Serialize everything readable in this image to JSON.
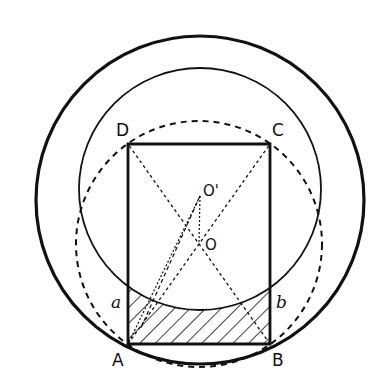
{
  "diagram": {
    "title": "",
    "colors": {
      "ink": "#111111",
      "background": "#ffffff"
    },
    "points": {
      "A": {
        "label": "A",
        "x": 128,
        "y": 344
      },
      "B": {
        "label": "B",
        "x": 270,
        "y": 344
      },
      "C": {
        "label": "C",
        "x": 270,
        "y": 144
      },
      "D": {
        "label": "D",
        "x": 128,
        "y": 144
      },
      "O": {
        "label": "O",
        "x": 199,
        "y": 244
      },
      "O_prime": {
        "label": "O'",
        "x": 200,
        "y": 196
      },
      "a": {
        "label": "a",
        "x": 128,
        "y": 300
      },
      "b": {
        "label": "b",
        "x": 270,
        "y": 300
      }
    },
    "circles": [
      {
        "name": "outer-circle",
        "cx": 200,
        "cy": 200,
        "r": 164,
        "style": "solid-thick"
      },
      {
        "name": "inner-circle",
        "cx": 200,
        "cy": 189,
        "r": 121,
        "style": "solid"
      },
      {
        "name": "circumscribed-circle",
        "cx": 199,
        "cy": 244,
        "r": 123,
        "style": "dashed"
      }
    ],
    "hatched_region": "segment between chord AB and arc a-b of inner circle"
  }
}
